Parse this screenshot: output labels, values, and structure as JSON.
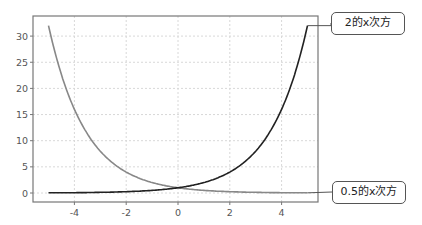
{
  "chart_data": {
    "type": "line",
    "title": "",
    "xlabel": "",
    "ylabel": "",
    "xlim": [
      -5.5,
      5.5
    ],
    "ylim": [
      -1.5,
      33.5
    ],
    "grid": true,
    "x_ticks": [
      -4,
      -2,
      0,
      2,
      4
    ],
    "y_ticks": [
      0,
      5,
      10,
      15,
      20,
      25,
      30
    ],
    "x_tick_labels": [
      "-4",
      "-2",
      "0",
      "2",
      "4"
    ],
    "y_tick_labels": [
      "0",
      "5",
      "10",
      "15",
      "20",
      "25",
      "30"
    ],
    "x": [
      -5,
      -4,
      -3,
      -2,
      -1,
      0,
      1,
      2,
      3,
      4,
      5
    ],
    "series": [
      {
        "name": "2的x次方",
        "color": "#222222",
        "values": [
          0.03125,
          0.0625,
          0.125,
          0.25,
          0.5,
          1,
          2,
          4,
          8,
          16,
          32
        ]
      },
      {
        "name": "0.5的x次方",
        "color": "#888888",
        "values": [
          32,
          16,
          8,
          4,
          2,
          1,
          0.5,
          0.25,
          0.125,
          0.0625,
          0.03125
        ]
      }
    ],
    "legend_position": "callout labels at right"
  },
  "labels": {
    "series1": "2的x次方",
    "series2": "0.5的x次方"
  }
}
